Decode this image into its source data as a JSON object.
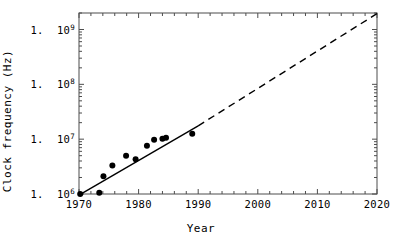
{
  "chart_data": {
    "type": "scatter",
    "title": "",
    "xlabel": "Year",
    "ylabel": "Clock frequency (Hz)",
    "xlim": [
      1970,
      2020
    ],
    "ylim": [
      1000000,
      2000000000
    ],
    "yscale": "log",
    "xscale": "linear",
    "grid": false,
    "legend": null,
    "xticks": [
      1970,
      1980,
      1990,
      2000,
      2010,
      2020
    ],
    "xtick_labels": [
      "1970",
      "1980",
      "1990",
      "2000",
      "2010",
      "2020"
    ],
    "yticks": [
      1000000,
      10000000,
      100000000,
      1000000000
    ],
    "ytick_labels": [
      {
        "mantissa": "1.",
        "base": "10",
        "exponent": "6"
      },
      {
        "mantissa": "1.",
        "base": "10",
        "exponent": "7"
      },
      {
        "mantissa": "1.",
        "base": "10",
        "exponent": "8"
      },
      {
        "mantissa": "1.",
        "base": "10",
        "exponent": "9"
      }
    ],
    "points": [
      {
        "x": 1970.2,
        "y": 1000000
      },
      {
        "x": 1973.4,
        "y": 1050000
      },
      {
        "x": 1974.1,
        "y": 2100000
      },
      {
        "x": 1975.6,
        "y": 3300000
      },
      {
        "x": 1977.9,
        "y": 5000000
      },
      {
        "x": 1979.5,
        "y": 4300000
      },
      {
        "x": 1981.4,
        "y": 7600000
      },
      {
        "x": 1982.6,
        "y": 9800000
      },
      {
        "x": 1984.0,
        "y": 10200000
      },
      {
        "x": 1984.6,
        "y": 10600000
      },
      {
        "x": 1989.0,
        "y": 12500000
      }
    ],
    "marker": {
      "shape": "circle",
      "size_px": 4.2,
      "color": "#000000"
    },
    "fit_line": {
      "style": "solid",
      "color": "#000000",
      "width_px": 1.4,
      "x_start": 1970.0,
      "y_start": 950000,
      "x_end": 1990.0,
      "y_end": 17500000
    },
    "extrapolation_line": {
      "style": "dashed",
      "color": "#000000",
      "width_px": 1.4,
      "dash_pattern": "7,5",
      "x_start": 1990.0,
      "y_start": 17500000,
      "x_end": 2020.0,
      "y_end": 1950000000
    },
    "frame": {
      "visible": true,
      "color": "#4d4d4d",
      "width_px": 1
    },
    "background": "#ffffff"
  }
}
